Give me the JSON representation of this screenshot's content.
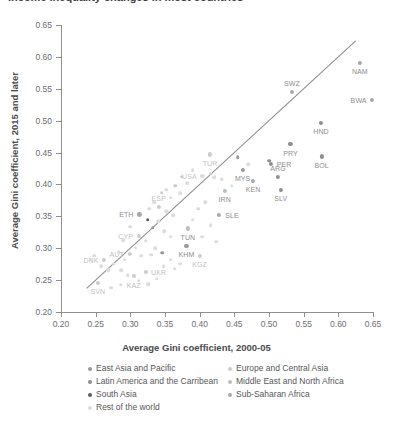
{
  "title": "Income inequality changes in most countries",
  "chart_data": {
    "type": "scatter",
    "title": "Income inequality changes in most countries",
    "xlabel": "Average Gini coefficient, 2000-05",
    "ylabel": "Average Gini coefficient, 2015 and later",
    "xlim": [
      0.2,
      0.65
    ],
    "ylim": [
      0.2,
      0.65
    ],
    "xticks": [
      "0.20",
      "0.25",
      "0.30",
      "0.35",
      "0.40",
      "0.45",
      "0.50",
      "0.55",
      "0.60",
      "0.65"
    ],
    "yticks": [
      "0.20",
      "0.25",
      "0.30",
      "0.35",
      "0.40",
      "0.45",
      "0.50",
      "0.55",
      "0.60",
      "0.65"
    ],
    "xtick_values": [
      0.2,
      0.25,
      0.3,
      0.35,
      0.4,
      0.45,
      0.5,
      0.55,
      0.6,
      0.65
    ],
    "ytick_values": [
      0.2,
      0.25,
      0.3,
      0.35,
      0.4,
      0.45,
      0.5,
      0.55,
      0.6,
      0.65
    ],
    "grid": false,
    "legend_position": "below-plot",
    "reference_line": {
      "type": "identity-45deg",
      "from": [
        0.237,
        0.237
      ],
      "to": [
        0.625,
        0.625
      ]
    },
    "series": [
      {
        "name": "East Asia and Pacific",
        "color": "#9a9a9c"
      },
      {
        "name": "Europe and Central Asia",
        "color": "#cccccd"
      },
      {
        "name": "Latin America and the Carribean",
        "color": "#8e8e90"
      },
      {
        "name": "Middle East and North Africa",
        "color": "#bdbdbe"
      },
      {
        "name": "South Asia",
        "color": "#5c5c5e"
      },
      {
        "name": "Sub-Saharan Africa",
        "color": "#a8a8aa"
      },
      {
        "name": "Rest of the world",
        "color": "#dcdcdd"
      }
    ],
    "points": [
      {
        "label": "NAM",
        "x": 0.631,
        "y": 0.591,
        "group": "Sub-Saharan Africa",
        "lp": "below"
      },
      {
        "label": "BWA",
        "x": 0.648,
        "y": 0.532,
        "group": "Sub-Saharan Africa",
        "lp": "left"
      },
      {
        "label": "SWZ",
        "x": 0.533,
        "y": 0.545,
        "group": "Sub-Saharan Africa",
        "lp": "above"
      },
      {
        "label": "HND",
        "x": 0.575,
        "y": 0.497,
        "group": "Latin America and the Carribean",
        "lp": "below"
      },
      {
        "label": "PRY",
        "x": 0.531,
        "y": 0.463,
        "group": "Latin America and the Carribean",
        "lp": "below"
      },
      {
        "label": "BOL",
        "x": 0.576,
        "y": 0.444,
        "group": "Latin America and the Carribean",
        "lp": "below"
      },
      {
        "label": "PER",
        "x": 0.503,
        "y": 0.432,
        "group": "Latin America and the Carribean",
        "lp": "right"
      },
      {
        "label": "",
        "x": 0.5,
        "y": 0.437,
        "group": "Latin America and the Carribean",
        "lp": "none"
      },
      {
        "label": "ARG",
        "x": 0.513,
        "y": 0.412,
        "group": "Latin America and the Carribean",
        "lp": "above"
      },
      {
        "label": "SLV",
        "x": 0.517,
        "y": 0.392,
        "group": "Latin America and the Carribean",
        "lp": "below"
      },
      {
        "label": "MYS",
        "x": 0.462,
        "y": 0.423,
        "group": "East Asia and Pacific",
        "lp": "below"
      },
      {
        "label": "KEN",
        "x": 0.477,
        "y": 0.406,
        "group": "Sub-Saharan Africa",
        "lp": "below"
      },
      {
        "label": "TUR",
        "x": 0.415,
        "y": 0.447,
        "group": "Europe and Central Asia",
        "lp": "below"
      },
      {
        "label": "",
        "x": 0.416,
        "y": 0.417,
        "group": "Europe and Central Asia",
        "lp": "none"
      },
      {
        "label": "USA",
        "x": 0.404,
        "y": 0.414,
        "group": "Rest of the world",
        "lp": "left"
      },
      {
        "label": "",
        "x": 0.421,
        "y": 0.411,
        "group": "Rest of the world",
        "lp": "none"
      },
      {
        "label": "",
        "x": 0.432,
        "y": 0.408,
        "group": "Rest of the world",
        "lp": "none"
      },
      {
        "label": "IRN",
        "x": 0.436,
        "y": 0.39,
        "group": "Middle East and North Africa",
        "lp": "below"
      },
      {
        "label": "SLE",
        "x": 0.428,
        "y": 0.352,
        "group": "Sub-Saharan Africa",
        "lp": "right"
      },
      {
        "label": "ESP",
        "x": 0.341,
        "y": 0.365,
        "group": "Europe and Central Asia",
        "lp": "above"
      },
      {
        "label": "ETH",
        "x": 0.313,
        "y": 0.353,
        "group": "Sub-Saharan Africa",
        "lp": "left"
      },
      {
        "label": "",
        "x": 0.325,
        "y": 0.345,
        "group": "South Asia",
        "lp": "none"
      },
      {
        "label": "CYP",
        "x": 0.312,
        "y": 0.319,
        "group": "Europe and Central Asia",
        "lp": "left"
      },
      {
        "label": "AUT",
        "x": 0.299,
        "y": 0.291,
        "group": "Europe and Central Asia",
        "lp": "left"
      },
      {
        "label": "TUN",
        "x": 0.383,
        "y": 0.331,
        "group": "Middle East and North Africa",
        "lp": "below"
      },
      {
        "label": "KHM",
        "x": 0.381,
        "y": 0.304,
        "group": "East Asia and Pacific",
        "lp": "below"
      },
      {
        "label": "KGZ",
        "x": 0.4,
        "y": 0.288,
        "group": "Europe and Central Asia",
        "lp": "below"
      },
      {
        "label": "DNK",
        "x": 0.262,
        "y": 0.282,
        "group": "Europe and Central Asia",
        "lp": "left"
      },
      {
        "label": "SVN",
        "x": 0.253,
        "y": 0.246,
        "group": "Europe and Central Asia",
        "lp": "below"
      },
      {
        "label": "KAZ",
        "x": 0.305,
        "y": 0.256,
        "group": "Europe and Central Asia",
        "lp": "below"
      },
      {
        "label": "UKR",
        "x": 0.322,
        "y": 0.263,
        "group": "Europe and Central Asia",
        "lp": "right"
      },
      {
        "label": "",
        "x": 0.358,
        "y": 0.379,
        "group": "Rest of the world",
        "lp": "none"
      },
      {
        "label": "",
        "x": 0.352,
        "y": 0.392,
        "group": "Rest of the world",
        "lp": "none"
      },
      {
        "label": "",
        "x": 0.365,
        "y": 0.398,
        "group": "Europe and Central Asia",
        "lp": "none"
      },
      {
        "label": "",
        "x": 0.372,
        "y": 0.386,
        "group": "Rest of the world",
        "lp": "none"
      },
      {
        "label": "",
        "x": 0.345,
        "y": 0.387,
        "group": "Europe and Central Asia",
        "lp": "none"
      },
      {
        "label": "",
        "x": 0.334,
        "y": 0.372,
        "group": "Rest of the world",
        "lp": "none"
      },
      {
        "label": "",
        "x": 0.327,
        "y": 0.362,
        "group": "Rest of the world",
        "lp": "none"
      },
      {
        "label": "",
        "x": 0.352,
        "y": 0.358,
        "group": "Rest of the world",
        "lp": "none"
      },
      {
        "label": "",
        "x": 0.362,
        "y": 0.352,
        "group": "Rest of the world",
        "lp": "none"
      },
      {
        "label": "",
        "x": 0.34,
        "y": 0.342,
        "group": "Rest of the world",
        "lp": "none"
      },
      {
        "label": "",
        "x": 0.332,
        "y": 0.332,
        "group": "East Asia and Pacific",
        "lp": "none"
      },
      {
        "label": "",
        "x": 0.349,
        "y": 0.327,
        "group": "Rest of the world",
        "lp": "none"
      },
      {
        "label": "",
        "x": 0.358,
        "y": 0.318,
        "group": "Rest of the world",
        "lp": "none"
      },
      {
        "label": "",
        "x": 0.322,
        "y": 0.312,
        "group": "Rest of the world",
        "lp": "none"
      },
      {
        "label": "",
        "x": 0.336,
        "y": 0.3,
        "group": "Rest of the world",
        "lp": "none"
      },
      {
        "label": "",
        "x": 0.346,
        "y": 0.293,
        "group": "East Asia and Pacific",
        "lp": "none"
      },
      {
        "label": "",
        "x": 0.316,
        "y": 0.288,
        "group": "Rest of the world",
        "lp": "none"
      },
      {
        "label": "",
        "x": 0.308,
        "y": 0.301,
        "group": "Rest of the world",
        "lp": "none"
      },
      {
        "label": "",
        "x": 0.29,
        "y": 0.313,
        "group": "Rest of the world",
        "lp": "none"
      },
      {
        "label": "",
        "x": 0.283,
        "y": 0.294,
        "group": "Rest of the world",
        "lp": "none"
      },
      {
        "label": "",
        "x": 0.276,
        "y": 0.276,
        "group": "Rest of the world",
        "lp": "none"
      },
      {
        "label": "",
        "x": 0.268,
        "y": 0.266,
        "group": "Rest of the world",
        "lp": "none"
      },
      {
        "label": "",
        "x": 0.258,
        "y": 0.272,
        "group": "Rest of the world",
        "lp": "none"
      },
      {
        "label": "",
        "x": 0.248,
        "y": 0.288,
        "group": "Rest of the world",
        "lp": "none"
      },
      {
        "label": "",
        "x": 0.243,
        "y": 0.282,
        "group": "Rest of the world",
        "lp": "none"
      },
      {
        "label": "",
        "x": 0.287,
        "y": 0.266,
        "group": "Rest of the world",
        "lp": "none"
      },
      {
        "label": "",
        "x": 0.296,
        "y": 0.258,
        "group": "Rest of the world",
        "lp": "none"
      },
      {
        "label": "",
        "x": 0.312,
        "y": 0.249,
        "group": "Rest of the world",
        "lp": "none"
      },
      {
        "label": "",
        "x": 0.326,
        "y": 0.244,
        "group": "Rest of the world",
        "lp": "none"
      },
      {
        "label": "",
        "x": 0.338,
        "y": 0.252,
        "group": "Rest of the world",
        "lp": "none"
      },
      {
        "label": "",
        "x": 0.286,
        "y": 0.243,
        "group": "Rest of the world",
        "lp": "none"
      },
      {
        "label": "",
        "x": 0.272,
        "y": 0.238,
        "group": "Rest of the world",
        "lp": "none"
      },
      {
        "label": "",
        "x": 0.364,
        "y": 0.268,
        "group": "Rest of the world",
        "lp": "none"
      },
      {
        "label": "",
        "x": 0.372,
        "y": 0.276,
        "group": "Rest of the world",
        "lp": "none"
      },
      {
        "label": "",
        "x": 0.39,
        "y": 0.345,
        "group": "Rest of the world",
        "lp": "none"
      },
      {
        "label": "",
        "x": 0.398,
        "y": 0.362,
        "group": "Rest of the world",
        "lp": "none"
      },
      {
        "label": "",
        "x": 0.408,
        "y": 0.372,
        "group": "Rest of the world",
        "lp": "none"
      },
      {
        "label": "",
        "x": 0.446,
        "y": 0.398,
        "group": "Rest of the world",
        "lp": "none"
      },
      {
        "label": "",
        "x": 0.455,
        "y": 0.443,
        "group": "East Asia and Pacific",
        "lp": "none"
      },
      {
        "label": "",
        "x": 0.47,
        "y": 0.432,
        "group": "Rest of the world",
        "lp": "none"
      },
      {
        "label": "",
        "x": 0.39,
        "y": 0.422,
        "group": "Rest of the world",
        "lp": "none"
      },
      {
        "label": "",
        "x": 0.382,
        "y": 0.402,
        "group": "Rest of the world",
        "lp": "none"
      },
      {
        "label": "",
        "x": 0.374,
        "y": 0.412,
        "group": "Europe and Central Asia",
        "lp": "none"
      },
      {
        "label": "",
        "x": 0.416,
        "y": 0.336,
        "group": "Rest of the world",
        "lp": "none"
      },
      {
        "label": "",
        "x": 0.404,
        "y": 0.318,
        "group": "Rest of the world",
        "lp": "none"
      },
      {
        "label": "",
        "x": 0.424,
        "y": 0.31,
        "group": "Rest of the world",
        "lp": "none"
      },
      {
        "label": "",
        "x": 0.3,
        "y": 0.334,
        "group": "Rest of the world",
        "lp": "none"
      },
      {
        "label": "",
        "x": 0.292,
        "y": 0.282,
        "group": "Rest of the world",
        "lp": "none"
      },
      {
        "label": "",
        "x": 0.358,
        "y": 0.282,
        "group": "Rest of the world",
        "lp": "none"
      },
      {
        "label": "",
        "x": 0.348,
        "y": 0.272,
        "group": "Rest of the world",
        "lp": "none"
      },
      {
        "label": "",
        "x": 0.33,
        "y": 0.29,
        "group": "Rest of the world",
        "lp": "none"
      }
    ]
  },
  "legend": {
    "col1": [
      {
        "label": "East Asia and Pacific",
        "color": "#9a9a9c"
      },
      {
        "label": "Latin America and the Carribean",
        "color": "#8e8e90"
      },
      {
        "label": "South Asia",
        "color": "#5c5c5e"
      },
      {
        "label": "Rest of the world",
        "color": "#dcdcdd"
      }
    ],
    "col2": [
      {
        "label": "Europe and Central Asia",
        "color": "#cccccd"
      },
      {
        "label": "Middle East and North Africa",
        "color": "#bdbdbe"
      },
      {
        "label": "Sub-Saharan Africa",
        "color": "#a8a8aa"
      }
    ]
  }
}
